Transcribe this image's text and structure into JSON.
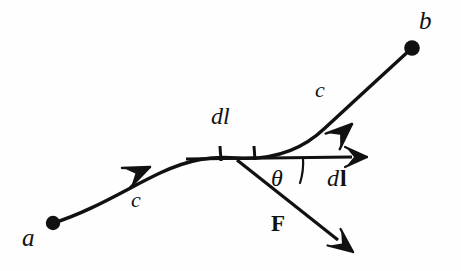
{
  "figure": {
    "kind": "line-integral-work-diagram",
    "background_color": "#fefefe",
    "stroke_color": "#111111",
    "width": 461,
    "height": 271
  },
  "labels": {
    "point_a": "a",
    "point_b": "b",
    "curve_lower": "c",
    "curve_upper": "c",
    "dl_scalar": "dl",
    "dl_vector_d": "d",
    "dl_vector_l": "l",
    "theta": "θ",
    "force": "F"
  },
  "elements": {
    "point_a_dot": "point-a-dot",
    "point_b_dot": "point-b-dot",
    "curve_path": "curve-c-path",
    "curve_arrow_lower": "curve-direction-arrow-lower",
    "curve_arrow_upper": "curve-direction-arrow-upper",
    "dl_vector_arrow": "dl-vector-arrow",
    "force_vector_arrow": "force-vector-arrow",
    "angle_arc": "theta-angle-arc",
    "tick_left": "dl-segment-tick-left",
    "tick_right": "dl-segment-tick-right"
  },
  "geometry": {
    "point_a": [
      53,
      223
    ],
    "point_b": [
      412,
      48
    ],
    "dl_origin": [
      237,
      160
    ],
    "dl_tip": [
      366,
      157
    ],
    "force_tip": [
      352,
      253
    ],
    "tick_left_x": 220,
    "tick_right_x": 254,
    "theta_degrees": 36
  }
}
